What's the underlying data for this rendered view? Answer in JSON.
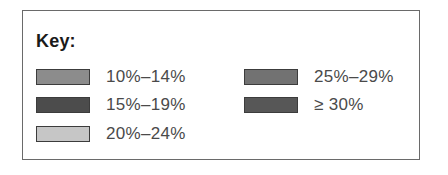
{
  "key": {
    "title": "Key:",
    "items": [
      {
        "label": "10%–14%",
        "color": "#8c8c8c",
        "column": 0,
        "row": 0
      },
      {
        "label": "15%–19%",
        "color": "#4c4c4c",
        "column": 0,
        "row": 1
      },
      {
        "label": "20%–24%",
        "color": "#c6c6c6",
        "column": 0,
        "row": 2
      },
      {
        "label": "25%–29%",
        "color": "#727272",
        "column": 1,
        "row": 0
      },
      {
        "label": "≥ 30%",
        "color": "#575757",
        "column": 1,
        "row": 1
      }
    ]
  }
}
